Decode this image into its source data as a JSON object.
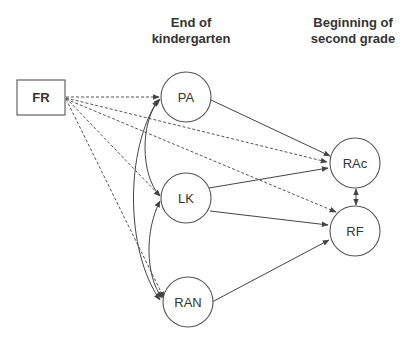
{
  "headers": {
    "kindergarten": [
      "End of",
      "kindergarten"
    ],
    "second_grade": [
      "Beginning of",
      "second grade"
    ]
  },
  "nodes": {
    "FR": {
      "label": "FR",
      "shape": "rectangle"
    },
    "PA": {
      "label": "PA",
      "shape": "circle"
    },
    "LK": {
      "label": "LK",
      "shape": "circle"
    },
    "RAN": {
      "label": "RAN",
      "shape": "circle"
    },
    "RAc": {
      "label": "RAc",
      "shape": "circle"
    },
    "RF": {
      "label": "RF",
      "shape": "circle"
    }
  },
  "edges": [
    {
      "from": "FR",
      "to": "PA",
      "style": "dashed"
    },
    {
      "from": "FR",
      "to": "LK",
      "style": "dashed"
    },
    {
      "from": "FR",
      "to": "RAN",
      "style": "dashed"
    },
    {
      "from": "FR",
      "to": "RAc",
      "style": "dashed"
    },
    {
      "from": "FR",
      "to": "RF",
      "style": "dashed"
    },
    {
      "from": "PA",
      "to": "RAc",
      "style": "solid"
    },
    {
      "from": "LK",
      "to": "RAc",
      "style": "solid"
    },
    {
      "from": "LK",
      "to": "RF",
      "style": "solid"
    },
    {
      "from": "RAN",
      "to": "RF",
      "style": "solid"
    },
    {
      "from": "RAc",
      "to": "RF",
      "style": "solid",
      "bidirectional": true
    },
    {
      "from": "PA",
      "to": "LK",
      "style": "solid-curved",
      "bidirectional": true
    },
    {
      "from": "LK",
      "to": "RAN",
      "style": "solid-curved",
      "bidirectional": true
    },
    {
      "from": "PA",
      "to": "RAN",
      "style": "solid-curved",
      "bidirectional": true
    }
  ]
}
